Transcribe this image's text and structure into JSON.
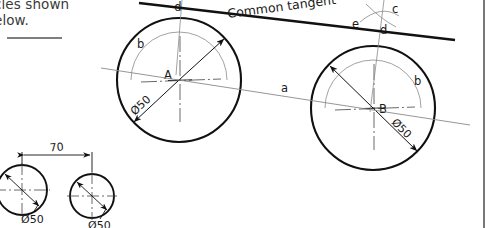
{
  "document": {
    "title": "Common tangent construction to two circles",
    "instruction_lines": [
      "cles shown",
      "elow."
    ],
    "border_color": "#555555"
  },
  "annotations": {
    "common_tangent": "Common tangent",
    "center_left": "A",
    "center_right": "B",
    "arc_b_left": "b",
    "arc_b_right": "b",
    "label_c": "c",
    "label_d_left": "d",
    "label_d_right": "d",
    "label_e": "e",
    "label_a": "a",
    "diameter_left": "Ø50",
    "diameter_right": "Ø50"
  },
  "lower_detail": {
    "distance_label": "70",
    "diameter_left": "Ø50",
    "diameter_right": "Ø50"
  },
  "geometry": {
    "circle_left": {
      "cx": 179,
      "cy": 80,
      "r": 62,
      "arc_r": 48
    },
    "circle_right": {
      "cx": 373,
      "cy": 108,
      "r": 62,
      "arc_r": 48
    },
    "small_circle_left": {
      "cx": 22,
      "cy": 190,
      "r": 25
    },
    "small_circle_right": {
      "cx": 92,
      "cy": 196,
      "r": 22
    },
    "stroke_heavy": "#111111",
    "stroke_thin": "#777777",
    "stroke_medium": "#333333"
  }
}
